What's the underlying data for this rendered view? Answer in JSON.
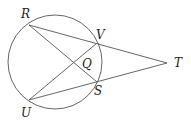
{
  "diagram": {
    "type": "geometry",
    "circle": {
      "cx": 55,
      "cy": 62,
      "r": 47
    },
    "points": {
      "R": {
        "label": "R",
        "x": 29,
        "y": 25,
        "lx": 21,
        "ly": 18
      },
      "V": {
        "label": "V",
        "x": 97,
        "y": 43,
        "lx": 96,
        "ly": 39
      },
      "Q": {
        "label": "Q",
        "x": 74,
        "y": 63,
        "lx": 82,
        "ly": 68
      },
      "S": {
        "label": "S",
        "x": 97,
        "y": 82,
        "lx": 94,
        "ly": 95
      },
      "U": {
        "label": "U",
        "x": 29,
        "y": 100,
        "lx": 21,
        "ly": 117
      },
      "T": {
        "label": "T",
        "x": 167,
        "y": 63,
        "lx": 174,
        "ly": 67
      }
    },
    "segments": [
      {
        "from": "R",
        "to": "T"
      },
      {
        "from": "U",
        "to": "T"
      },
      {
        "from": "R",
        "to": "S"
      },
      {
        "from": "U",
        "to": "V"
      }
    ],
    "colors": {
      "stroke": "#555555",
      "text": "#222222",
      "background": "#ffffff"
    }
  }
}
